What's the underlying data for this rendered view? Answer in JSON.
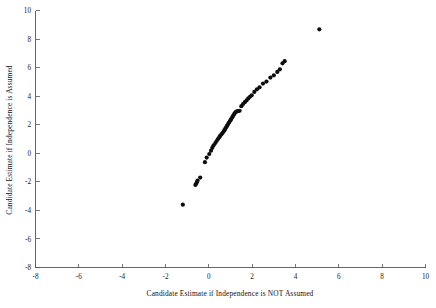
{
  "figure": {
    "background_color": "#ffffff",
    "point_color": "#0d0d0d",
    "axis_color": "#555555"
  },
  "axis": {
    "x_title": "Candidate  Estimate if Independence is NOT Assumed",
    "y_title": "Candidate Estimate if Independence is Assumed",
    "x_ticks": [
      "-8",
      "-6",
      "-4",
      "-2",
      "0",
      "2",
      "4",
      "6",
      "8",
      "10"
    ],
    "y_ticks": [
      "10",
      "8",
      "6",
      "4",
      "2",
      "0",
      "-2",
      "-4",
      "-6",
      "-8"
    ]
  },
  "chart_data": {
    "type": "scatter",
    "title": "",
    "xlabel": "Candidate  Estimate if Independence is NOT Assumed",
    "ylabel": "Candidate Estimate if Independence is Assumed",
    "xlim": [
      -8,
      10
    ],
    "ylim": [
      -8,
      10
    ],
    "xticks": [
      -8,
      -6,
      -4,
      -2,
      0,
      2,
      4,
      6,
      8,
      10
    ],
    "yticks": [
      -8,
      -6,
      -4,
      -2,
      0,
      2,
      4,
      6,
      8,
      10
    ],
    "grid": false,
    "legend": null,
    "marker": "filled-circle",
    "marker_size": 2.1,
    "series": [
      {
        "name": "candidate estimates",
        "x": [
          -1.2,
          -0.62,
          -0.58,
          -0.55,
          -0.52,
          -0.4,
          -0.18,
          -0.1,
          0.02,
          0.1,
          0.16,
          0.22,
          0.3,
          0.36,
          0.42,
          0.48,
          0.52,
          0.58,
          0.63,
          0.68,
          0.72,
          0.76,
          0.8,
          0.84,
          0.88,
          0.92,
          0.96,
          1.0,
          1.04,
          1.08,
          1.12,
          1.16,
          1.2,
          1.25,
          1.3,
          1.36,
          1.42,
          1.5,
          1.58,
          1.66,
          1.74,
          1.82,
          1.9,
          1.98,
          2.1,
          2.22,
          2.34,
          2.5,
          2.66,
          2.84,
          3.0,
          3.16,
          3.28,
          3.4,
          3.5,
          5.1
        ],
        "y": [
          -3.6,
          -2.22,
          -2.12,
          -2.02,
          -1.92,
          -1.7,
          -0.62,
          -0.3,
          -0.05,
          0.18,
          0.38,
          0.56,
          0.72,
          0.86,
          1.0,
          1.12,
          1.22,
          1.32,
          1.42,
          1.52,
          1.62,
          1.72,
          1.82,
          1.92,
          2.02,
          2.12,
          2.22,
          2.32,
          2.42,
          2.52,
          2.62,
          2.72,
          2.82,
          2.9,
          2.94,
          2.96,
          2.98,
          3.3,
          3.45,
          3.58,
          3.7,
          3.84,
          3.96,
          4.06,
          4.3,
          4.48,
          4.62,
          4.88,
          5.02,
          5.3,
          5.46,
          5.7,
          5.88,
          6.3,
          6.45,
          8.68
        ]
      }
    ]
  }
}
